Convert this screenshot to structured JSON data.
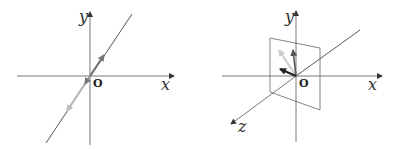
{
  "left_panel": {
    "labels": {
      "x": "x",
      "y": "y",
      "origin": "O"
    },
    "description": "2D plane with a line through origin; dark-gray vector pointing up-right along line and light-gray vector pointing down-left along line",
    "colors": {
      "axis": "#555555",
      "line": "#444444",
      "vector_dark": "#777777",
      "vector_light": "#bbbbbb"
    }
  },
  "right_panel": {
    "labels": {
      "x": "x",
      "y": "y",
      "z": "z",
      "origin": "O"
    },
    "description": "3D axes with a line through origin and a perpendicular plane containing three vectors at the origin",
    "colors": {
      "axis": "#555555",
      "plane": "#666666",
      "vector_dark": "#333333",
      "vector_mid": "#555555",
      "vector_light": "#cccccc"
    }
  }
}
